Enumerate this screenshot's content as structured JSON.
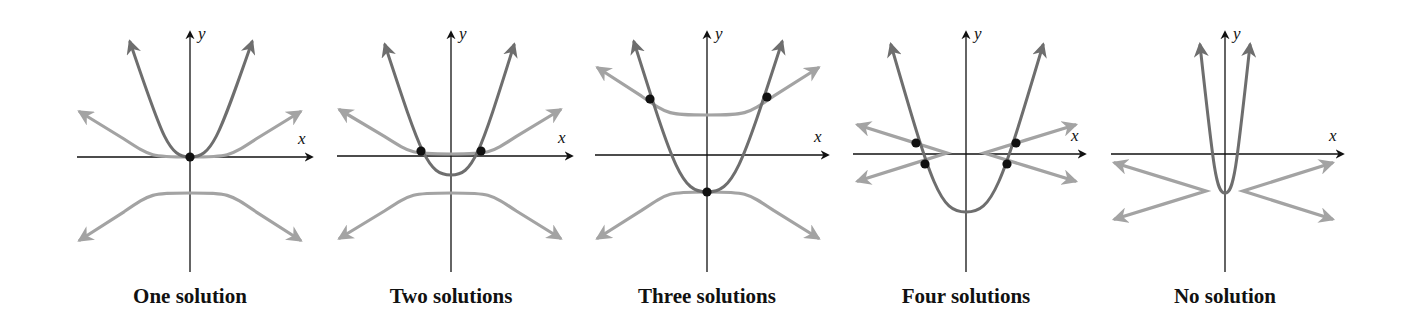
{
  "figure": {
    "colors": {
      "parabola": "#6e6e6e",
      "hyperbola": "#a3a3a3",
      "axis": "#111111",
      "point": "#111111",
      "background": "#ffffff"
    },
    "axis_labels": {
      "x": "x",
      "y": "y"
    }
  },
  "chart_data": [
    {
      "type": "diagram",
      "title": "One solution",
      "origin": [
        190,
        157
      ],
      "axes": {
        "x_range": [
          77,
          312
        ],
        "y_range": [
          272,
          32
        ]
      },
      "parabola": {
        "vertex_y": 157,
        "ends": [
          [
            130,
            42
          ],
          [
            252,
            42
          ]
        ]
      },
      "hyperbolas": [
        {
          "orientation": "up",
          "vertex_y": 157,
          "ends": [
            [
              80,
              112
            ],
            [
              300,
              112
            ]
          ]
        },
        {
          "orientation": "down",
          "vertex_y": 193,
          "ends": [
            [
              80,
              240
            ],
            [
              300,
              240
            ]
          ]
        }
      ],
      "points": [
        [
          190,
          157
        ]
      ]
    },
    {
      "type": "diagram",
      "title": "Two solutions",
      "origin": [
        451,
        156
      ],
      "axes": {
        "x_range": [
          337,
          572
        ],
        "y_range": [
          272,
          32
        ]
      },
      "parabola": {
        "vertex_y": 175,
        "ends": [
          [
            385,
            45
          ],
          [
            514,
            45
          ]
        ]
      },
      "hyperbolas": [
        {
          "orientation": "up",
          "vertex_y": 154,
          "ends": [
            [
              340,
              110
            ],
            [
              560,
              110
            ]
          ]
        },
        {
          "orientation": "down",
          "vertex_y": 193,
          "ends": [
            [
              340,
              238
            ],
            [
              560,
              238
            ]
          ]
        }
      ],
      "points": [
        [
          421,
          151
        ],
        [
          481,
          151
        ]
      ]
    },
    {
      "type": "diagram",
      "title": "Three solutions",
      "origin": [
        707,
        155
      ],
      "axes": {
        "x_range": [
          595,
          828
        ],
        "y_range": [
          272,
          32
        ]
      },
      "parabola": {
        "vertex_y": 192,
        "ends": [
          [
            634,
            42
          ],
          [
            782,
            42
          ]
        ]
      },
      "hyperbolas": [
        {
          "orientation": "up",
          "vertex_y": 115,
          "ends": [
            [
              598,
              68
            ],
            [
              818,
              68
            ]
          ]
        },
        {
          "orientation": "down",
          "vertex_y": 192,
          "ends": [
            [
              598,
              238
            ],
            [
              818,
              238
            ]
          ]
        }
      ],
      "points": [
        [
          650,
          99
        ],
        [
          767,
          97
        ],
        [
          707,
          192
        ]
      ]
    },
    {
      "type": "diagram",
      "title": "Four solutions",
      "origin": [
        966,
        154
      ],
      "axes": {
        "x_range": [
          853,
          1085
        ],
        "y_range": [
          272,
          32
        ]
      },
      "parabola": {
        "vertex_y": 212,
        "ends": [
          [
            891,
            45
          ],
          [
            1043,
            45
          ]
        ]
      },
      "hyperbolas": [
        {
          "orientation": "left",
          "vertex_x": 947,
          "ends": [
            [
              858,
              125
            ],
            [
              858,
              181
            ]
          ]
        },
        {
          "orientation": "right",
          "vertex_x": 984,
          "ends": [
            [
              1075,
              125
            ],
            [
              1075,
              181
            ]
          ]
        }
      ],
      "points": [
        [
          916,
          143
        ],
        [
          925,
          164
        ],
        [
          1016,
          143
        ],
        [
          1007,
          164
        ]
      ]
    },
    {
      "type": "diagram",
      "title": "No solution",
      "origin": [
        1225,
        154
      ],
      "axes": {
        "x_range": [
          1111,
          1343
        ],
        "y_range": [
          272,
          32
        ]
      },
      "parabola": {
        "vertex_y": 193,
        "ends": [
          [
            1200,
            45
          ],
          [
            1250,
            45
          ]
        ]
      },
      "hyperbolas": [
        {
          "orientation": "left",
          "vertex_x": 1206,
          "ends": [
            [
              1115,
              163
            ],
            [
              1115,
              219
            ]
          ]
        },
        {
          "orientation": "right",
          "vertex_x": 1243,
          "ends": [
            [
              1332,
              163
            ],
            [
              1332,
              219
            ]
          ]
        }
      ],
      "points": []
    }
  ],
  "labels": [
    {
      "text": "One solution",
      "cx": 190
    },
    {
      "text": "Two solutions",
      "cx": 451
    },
    {
      "text": "Three solutions",
      "cx": 707
    },
    {
      "text": "Four solutions",
      "cx": 966
    },
    {
      "text": "No solution",
      "cx": 1225
    }
  ]
}
